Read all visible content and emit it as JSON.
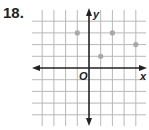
{
  "problem_number": "18.",
  "graph": {
    "x_axis_label": "x",
    "y_axis_label": "y",
    "origin_label": "O",
    "grid": {
      "x_min": -4,
      "x_max": 4,
      "y_min": -4,
      "y_max": 4
    },
    "points": [
      {
        "x": -1,
        "y": 3
      },
      {
        "x": 2,
        "y": 3
      },
      {
        "x": 1,
        "y": 1
      },
      {
        "x": 4,
        "y": 2
      }
    ],
    "colors": {
      "grid": "#b8b8b8",
      "axis": "#222222",
      "point": "#a8a8a8"
    }
  }
}
